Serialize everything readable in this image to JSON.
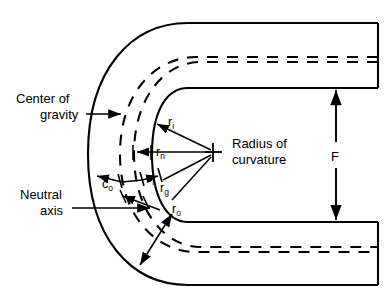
{
  "figure": {
    "background_color": "#ffffff",
    "line_color": "#000000"
  },
  "labels": {
    "center_of_gravity_line1": "Center of",
    "center_of_gravity_line2": "gravity",
    "neutral_axis_line1": "Neutral",
    "neutral_axis_line2": "axis",
    "radius_of_curvature_line1": "Radius of",
    "radius_of_curvature_line2": "curvature",
    "depth_dimension": "F"
  },
  "radii": {
    "r_inner": {
      "base": "r",
      "sub": "i"
    },
    "r_neutral": {
      "base": "r",
      "sub": "n"
    },
    "r_gravity": {
      "base": "r",
      "sub": "g"
    },
    "r_outer": {
      "base": "r",
      "sub": "o"
    }
  },
  "distances": {
    "c_outer": {
      "base": "c",
      "sub": "o"
    },
    "c_inner": {
      "base": "c",
      "sub": "i"
    }
  },
  "center_of_curvature": {
    "x": 213,
    "y": 152,
    "marker": "cross"
  }
}
